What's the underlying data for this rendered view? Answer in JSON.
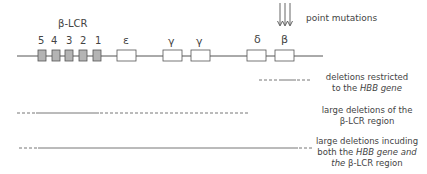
{
  "lcr": {
    "title": "β-LCR",
    "sites": [
      "5",
      "4",
      "3",
      "2",
      "1"
    ]
  },
  "genes": [
    {
      "name": "ε"
    },
    {
      "name": "γ"
    },
    {
      "name": "γ"
    },
    {
      "name": "δ"
    },
    {
      "name": "β"
    }
  ],
  "point_mutations": {
    "label": "point mutations"
  },
  "deletions": [
    {
      "id": "hbb",
      "lines": [
        {
          "text": "deletions restricted"
        },
        {
          "pre": "to the ",
          "italic": "HBB gene",
          "post": ""
        }
      ]
    },
    {
      "id": "lcr",
      "lines": [
        {
          "text": "large deletions of the"
        },
        {
          "text": "β-LCR region"
        }
      ]
    },
    {
      "id": "both",
      "lines": [
        {
          "text": "large deletions incuding"
        },
        {
          "pre": "both the ",
          "italic": "HBB gene and",
          "post": ""
        },
        {
          "pre": "",
          "italic": "the",
          "post": " β-LCR region"
        }
      ]
    }
  ],
  "colors": {
    "line": "#555555",
    "lcr_fill": "#b4b4b4",
    "gene_fill": "#ffffff",
    "text": "#444444"
  }
}
